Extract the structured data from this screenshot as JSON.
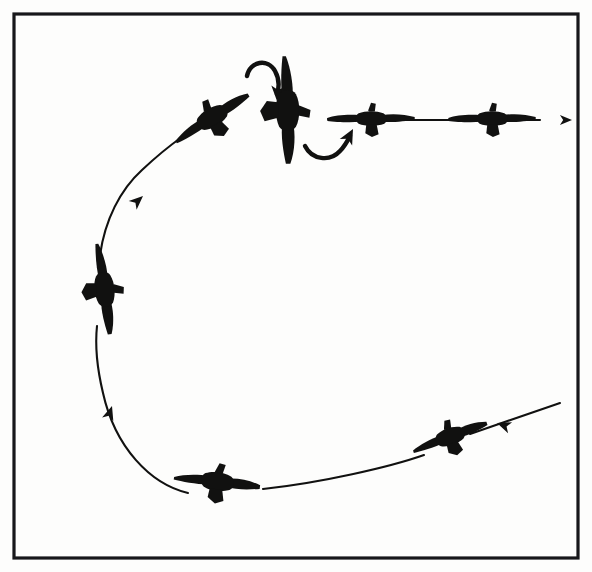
{
  "figure": {
    "title": "Steep turn reversal sequence",
    "background_color": "#fdfdfc",
    "ink_color": "#111110",
    "frame": {
      "label": "figure-border",
      "stroke_color": "#17171a",
      "stroke_width": 3.2,
      "x": 14,
      "y": 14,
      "width": 564,
      "height": 544
    }
  },
  "flight_path": {
    "label": "flight path",
    "style": "solid thin line, broken where aircraft silhouettes overlap",
    "direction": "counter-clockwise",
    "stroke_width": 2.1,
    "segments": [
      {
        "name": "entry-leg-lower-right",
        "d": "M 560 403 L 470 434"
      },
      {
        "name": "bottom-leg",
        "d": "M 424 455 C 390 467, 320 483, 263 489"
      },
      {
        "name": "lower-left-arc",
        "d": "M 188 493 C 150 484, 115 447, 103 393 C 97 368, 95 345, 97 326"
      },
      {
        "name": "upper-left-arc",
        "d": "M 100 255 C 105 220, 120 190, 142 170 C 158 155, 172 144, 182 137"
      },
      {
        "name": "exit-leg-one",
        "d": "M 328 119 L 342 119"
      },
      {
        "name": "exit-leg-two",
        "d": "M 400 120 L 462 120"
      },
      {
        "name": "exit-leg-three",
        "d": "M 523 120 L 540 120"
      }
    ]
  },
  "direction_arrows": [
    {
      "name": "entry-arrowhead",
      "position": "lower right, pointing down-left into the turn",
      "angle_deg": 200,
      "x": 497,
      "y": 423,
      "size": 15
    },
    {
      "name": "lower-left-arrowhead",
      "position": "lower left arc, pointing up along the turn",
      "angle_deg": 288,
      "x": 112,
      "y": 406,
      "size": 15
    },
    {
      "name": "upper-left-arrowhead",
      "position": "upper left arc, pointing up-right out of the turn",
      "angle_deg": 318,
      "x": 143,
      "y": 196,
      "size": 15
    },
    {
      "name": "exit-arrowhead",
      "position": "far right, level flight departure direction",
      "angle_deg": 0,
      "x": 572,
      "y": 120,
      "size": 13
    }
  ],
  "roll_arrows": [
    {
      "name": "roll-arrow-top",
      "description": "curved arrow above the banked aircraft, sweeping left-to-right and pointing down",
      "path": "M 247 76 C 250 61, 268 58, 275 71 C 280 80, 279 88, 277 94",
      "head_x": 277,
      "head_y": 101,
      "head_angle_deg": 95,
      "stroke_width": 4.4
    },
    {
      "name": "roll-arrow-bottom",
      "description": "curved arrow below the banked aircraft, sweeping left-to-right and pointing up",
      "path": "M 305 146 C 312 160, 330 162, 340 151 C 345 146, 348 140, 350 136",
      "head_x": 353,
      "head_y": 129,
      "head_angle_deg": 298,
      "stroke_width": 4.4
    }
  ],
  "aircraft": [
    {
      "index": 1,
      "name": "aircraft-entry-banked",
      "phase": "entering turn",
      "bank": "steeply banked left",
      "x": 450,
      "y": 437,
      "rotation_deg": -19,
      "scale": 0.82,
      "view": "rear three-quarter"
    },
    {
      "index": 2,
      "name": "aircraft-bottom-banked",
      "phase": "mid turn, bottom of arc",
      "bank": "steeply banked",
      "x": 217,
      "y": 482,
      "rotation_deg": 8,
      "scale": 0.9,
      "view": "rear three-quarter"
    },
    {
      "index": 3,
      "name": "aircraft-left-knife-edge",
      "phase": "90 degrees through the turn",
      "bank": "near vertical, wings perpendicular to horizon",
      "x": 104,
      "y": 289,
      "rotation_deg": 84,
      "scale": 0.95,
      "view": "rear, wings vertical"
    },
    {
      "index": 4,
      "name": "aircraft-upper-left-rolling-out",
      "phase": "rolling out of the turn",
      "bank": "banked, decreasing",
      "x": 212,
      "y": 118,
      "rotation_deg": -31,
      "scale": 0.9,
      "view": "rear three-quarter"
    },
    {
      "index": 5,
      "name": "aircraft-center-wings-vertical",
      "phase": "roll reversal point",
      "bank": "wings vertical, knife-edge",
      "x": 287,
      "y": 110,
      "rotation_deg": 90,
      "scale": 1.12,
      "view": "rear, wings vertical"
    },
    {
      "index": 6,
      "name": "aircraft-level-first",
      "phase": "wings level, straight flight",
      "bank": "level",
      "x": 371,
      "y": 119,
      "rotation_deg": 0,
      "scale": 0.95,
      "view": "rear, level"
    },
    {
      "index": 7,
      "name": "aircraft-level-second",
      "phase": "wings level, departing",
      "bank": "level",
      "x": 492,
      "y": 119,
      "rotation_deg": 0,
      "scale": 0.95,
      "view": "rear, level"
    }
  ]
}
